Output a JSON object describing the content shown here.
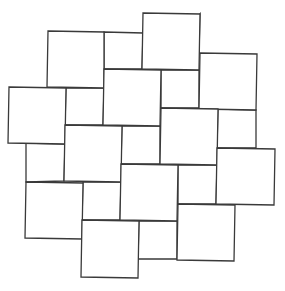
{
  "diagram": {
    "type": "pythagorean-tiling",
    "stroke_color": "#3a3a3a",
    "background": "#ffffff",
    "large_squares": [
      {
        "id": "A",
        "pts": [
          [
            48,
            31
          ],
          [
            104,
            32
          ],
          [
            104,
            88
          ],
          [
            47,
            87
          ]
        ]
      },
      {
        "id": "B",
        "pts": [
          [
            143,
            13
          ],
          [
            200,
            14
          ],
          [
            199,
            70
          ],
          [
            142,
            69
          ]
        ]
      },
      {
        "id": "C",
        "pts": [
          [
            9,
            87
          ],
          [
            66,
            88
          ],
          [
            65,
            144
          ],
          [
            8,
            143
          ]
        ]
      },
      {
        "id": "D",
        "pts": [
          [
            104,
            69
          ],
          [
            161,
            70
          ],
          [
            160,
            126
          ],
          [
            103,
            125
          ]
        ]
      },
      {
        "id": "E",
        "pts": [
          [
            200,
            53
          ],
          [
            257,
            54
          ],
          [
            256,
            110
          ],
          [
            199,
            109
          ]
        ]
      },
      {
        "id": "F",
        "pts": [
          [
            65,
            125
          ],
          [
            122,
            126
          ],
          [
            121,
            182
          ],
          [
            64,
            181
          ]
        ]
      },
      {
        "id": "G",
        "pts": [
          [
            161,
            108
          ],
          [
            218,
            109
          ],
          [
            217,
            165
          ],
          [
            160,
            164
          ]
        ]
      },
      {
        "id": "H",
        "pts": [
          [
            26,
            182
          ],
          [
            83,
            183
          ],
          [
            82,
            239
          ],
          [
            25,
            238
          ]
        ]
      },
      {
        "id": "I",
        "pts": [
          [
            121,
            164
          ],
          [
            178,
            165
          ],
          [
            177,
            221
          ],
          [
            120,
            220
          ]
        ]
      },
      {
        "id": "J",
        "pts": [
          [
            217,
            148
          ],
          [
            275,
            149
          ],
          [
            274,
            205
          ],
          [
            216,
            204
          ]
        ]
      },
      {
        "id": "K",
        "pts": [
          [
            82,
            220
          ],
          [
            139,
            221
          ],
          [
            138,
            278
          ],
          [
            81,
            277
          ]
        ]
      },
      {
        "id": "L",
        "pts": [
          [
            178,
            204
          ],
          [
            235,
            205
          ],
          [
            234,
            261
          ],
          [
            177,
            260
          ]
        ]
      }
    ],
    "small_squares": [
      {
        "id": "a",
        "pts": [
          [
            104,
            32
          ],
          [
            143,
            33
          ],
          [
            142,
            69
          ],
          [
            104,
            69
          ]
        ]
      },
      {
        "id": "b",
        "pts": [
          [
            200,
            14
          ],
          [
            199,
            53
          ],
          [
            161,
            70
          ],
          [
            161,
            70
          ]
        ]
      },
      {
        "id": "c",
        "pts": [
          [
            66,
            88
          ],
          [
            104,
            88
          ],
          [
            103,
            125
          ],
          [
            65,
            125
          ]
        ]
      },
      {
        "id": "d",
        "pts": [
          [
            161,
            70
          ],
          [
            199,
            70
          ],
          [
            199,
            108
          ],
          [
            161,
            108
          ]
        ]
      },
      {
        "id": "e",
        "pts": [
          [
            26,
            143
          ],
          [
            65,
            144
          ],
          [
            64,
            181
          ],
          [
            26,
            182
          ]
        ]
      },
      {
        "id": "f",
        "pts": [
          [
            122,
            126
          ],
          [
            160,
            126
          ],
          [
            160,
            164
          ],
          [
            121,
            164
          ]
        ]
      },
      {
        "id": "g",
        "pts": [
          [
            218,
            109
          ],
          [
            256,
            110
          ],
          [
            256,
            148
          ],
          [
            217,
            148
          ]
        ]
      },
      {
        "id": "h",
        "pts": [
          [
            83,
            182
          ],
          [
            121,
            182
          ],
          [
            120,
            220
          ],
          [
            82,
            220
          ]
        ]
      },
      {
        "id": "i",
        "pts": [
          [
            178,
            165
          ],
          [
            217,
            165
          ],
          [
            216,
            204
          ],
          [
            178,
            204
          ]
        ]
      },
      {
        "id": "j",
        "pts": [
          [
            139,
            221
          ],
          [
            177,
            221
          ],
          [
            177,
            259
          ],
          [
            138,
            259
          ]
        ]
      }
    ]
  }
}
